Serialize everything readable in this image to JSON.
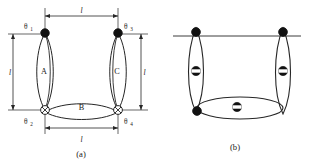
{
  "figure": {
    "panels": [
      {
        "id": "a",
        "caption": "(a)",
        "loops": [
          {
            "name": "A",
            "label": "A"
          },
          {
            "name": "B",
            "label": "B"
          },
          {
            "name": "C",
            "label": "C"
          }
        ],
        "joints": [
          {
            "name": "theta-1",
            "symbol": "θ",
            "subscript": "1",
            "marker": "filled-circle",
            "position": "top-left"
          },
          {
            "name": "theta-3",
            "symbol": "θ",
            "subscript": "3",
            "marker": "filled-circle",
            "position": "top-right"
          },
          {
            "name": "theta-2",
            "symbol": "θ",
            "subscript": "2",
            "marker": "crossed-circle",
            "position": "bottom-left"
          },
          {
            "name": "theta-4",
            "symbol": "θ",
            "subscript": "4",
            "marker": "crossed-circle",
            "position": "bottom-right"
          }
        ],
        "dimensions": [
          {
            "name": "top-span",
            "label": "l"
          },
          {
            "name": "left-span",
            "label": "l"
          },
          {
            "name": "right-span",
            "label": "l"
          },
          {
            "name": "bottom-span",
            "label": "l"
          }
        ]
      },
      {
        "id": "b",
        "caption": "(b)",
        "loops": [
          {
            "name": "left-loop",
            "label": ""
          },
          {
            "name": "right-loop",
            "label": ""
          },
          {
            "name": "bottom-loop",
            "label": ""
          }
        ],
        "markers": [
          {
            "name": "corner-node-top-left",
            "marker": "filled-circle"
          },
          {
            "name": "corner-node-top-right",
            "marker": "filled-circle"
          },
          {
            "name": "corner-node-bottom-left",
            "marker": "filled-circle"
          },
          {
            "name": "band-node-left",
            "marker": "banded-circle"
          },
          {
            "name": "band-node-right",
            "marker": "banded-circle"
          },
          {
            "name": "band-node-bottom",
            "marker": "banded-circle"
          }
        ]
      }
    ],
    "colors": {
      "stroke": "#262626",
      "fill_node": "#111111",
      "background": "#ffffff",
      "band": "#ffffff"
    }
  }
}
